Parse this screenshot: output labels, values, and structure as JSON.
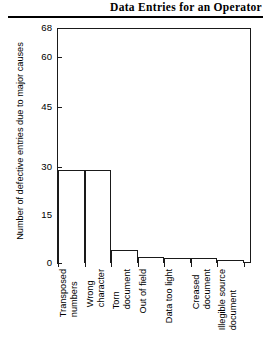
{
  "header": {
    "title": "Data Entries for an Operator"
  },
  "chart_data": {
    "type": "bar",
    "title": "Data Entries for an Operator",
    "xlabel": "",
    "ylabel": "Number of defective entries due to major causes",
    "categories": [
      "Transposed numbers",
      "Wrong character",
      "Torn document",
      "Out of field",
      "Data too light",
      "Creased document",
      "Illegible source document"
    ],
    "category_lines": [
      [
        "Transposed",
        "numbers"
      ],
      [
        "Wrong",
        "character"
      ],
      [
        "Torn",
        "document"
      ],
      [
        "Out of field"
      ],
      [
        "Data too light"
      ],
      [
        "Creased",
        "document"
      ],
      [
        "Illegible source",
        "document"
      ]
    ],
    "values": [
      29,
      29,
      4,
      2,
      1.5,
      1.5,
      1
    ],
    "ytick_labels": [
      "68",
      "60",
      "45",
      "30",
      "15",
      "0"
    ],
    "ytick_values": [
      68,
      60,
      45,
      30,
      15,
      0
    ],
    "ylim": [
      0,
      68
    ],
    "grid": false,
    "legend": "none",
    "bar_fill": "#ffffff",
    "bar_edge": "#1a1a1a",
    "axis_color": "#1a1a1a"
  }
}
